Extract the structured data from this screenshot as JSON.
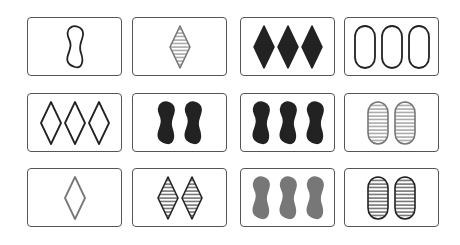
{
  "game": "SET",
  "colors": {
    "black": "#222222",
    "gray": "#777777",
    "lightgray": "#8a8a8a"
  },
  "cards": [
    {
      "id": "r1c1",
      "row": 1,
      "col": 1,
      "count": 1,
      "shape": "squiggle",
      "fill": "outline",
      "color": "black",
      "label": "1 black outline squiggle"
    },
    {
      "id": "r1c2",
      "row": 1,
      "col": 2,
      "count": 1,
      "shape": "diamond",
      "fill": "striped",
      "color": "gray",
      "label": "1 gray striped diamond"
    },
    {
      "id": "r1c3",
      "row": 1,
      "col": 3,
      "count": 3,
      "shape": "diamond",
      "fill": "solid",
      "color": "black",
      "label": "3 black solid diamonds"
    },
    {
      "id": "r1c4",
      "row": 1,
      "col": 4,
      "count": 3,
      "shape": "oval",
      "fill": "outline",
      "color": "black",
      "label": "3 black outline ovals"
    },
    {
      "id": "r2c1",
      "row": 2,
      "col": 1,
      "count": 3,
      "shape": "diamond",
      "fill": "outline",
      "color": "black",
      "label": "3 black outline diamonds"
    },
    {
      "id": "r2c2",
      "row": 2,
      "col": 2,
      "count": 2,
      "shape": "squiggle",
      "fill": "solid",
      "color": "black",
      "label": "2 black solid squiggles"
    },
    {
      "id": "r2c3",
      "row": 2,
      "col": 3,
      "count": 3,
      "shape": "squiggle",
      "fill": "solid",
      "color": "black",
      "label": "3 black solid squiggles"
    },
    {
      "id": "r2c4",
      "row": 2,
      "col": 4,
      "count": 2,
      "shape": "oval",
      "fill": "striped",
      "color": "gray",
      "label": "2 gray striped ovals"
    },
    {
      "id": "r3c1",
      "row": 3,
      "col": 1,
      "count": 1,
      "shape": "diamond",
      "fill": "outline",
      "color": "gray",
      "label": "1 gray outline diamond"
    },
    {
      "id": "r3c2",
      "row": 3,
      "col": 2,
      "count": 2,
      "shape": "diamond",
      "fill": "striped",
      "color": "black",
      "label": "2 black striped diamonds"
    },
    {
      "id": "r3c3",
      "row": 3,
      "col": 3,
      "count": 3,
      "shape": "squiggle",
      "fill": "solid",
      "color": "gray",
      "label": "3 gray solid squiggles"
    },
    {
      "id": "r3c4",
      "row": 3,
      "col": 4,
      "count": 2,
      "shape": "oval",
      "fill": "striped",
      "color": "black",
      "label": "2 black striped ovals"
    }
  ]
}
